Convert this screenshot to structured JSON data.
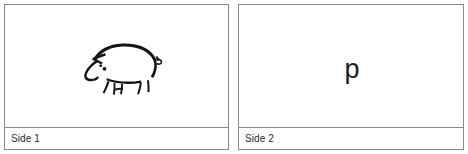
{
  "panels": [
    {
      "id": "side-1",
      "label": "Side 1",
      "content_type": "image",
      "content_description": "pig-line-drawing"
    },
    {
      "id": "side-2",
      "label": "Side 2",
      "content_type": "text",
      "content_value": "p"
    }
  ],
  "colors": {
    "border": "#8a8a8a",
    "background": "#ffffff",
    "ink": "#141414",
    "label_text": "#2b2b2b"
  }
}
